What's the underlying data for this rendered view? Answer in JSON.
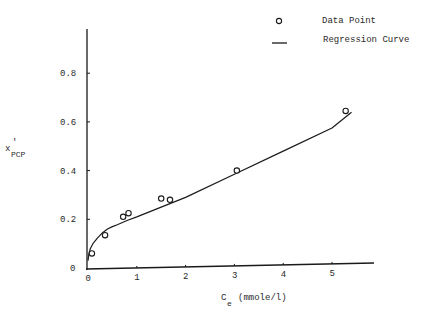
{
  "chart_data": {
    "type": "scatter",
    "title": "",
    "xlabel": "C_e (mmole/l)",
    "xlabel_main": "C",
    "xlabel_sub": "e",
    "xlabel_unit": "(mmole/l)",
    "ylabel": "x'_PCP",
    "ylabel_main": "x",
    "ylabel_prime": "'",
    "ylabel_sub": "PCP",
    "xlim": [
      0,
      5.8
    ],
    "ylim": [
      0,
      1.0
    ],
    "x_ticks": [
      0,
      1,
      2,
      3,
      4,
      5
    ],
    "x_tick_labels": [
      "0",
      "1",
      "2",
      "3",
      "4",
      "5"
    ],
    "y_ticks": [
      0,
      0.2,
      0.4,
      0.6,
      0.8
    ],
    "y_tick_labels": [
      "0",
      "0.2",
      "0.4",
      "0.6",
      "0.8"
    ],
    "grid": false,
    "legend_position": "top-right",
    "legend": [
      {
        "label": "Data Point",
        "marker": "open-circle"
      },
      {
        "label": "Regression Curve",
        "marker": "line"
      }
    ],
    "series": [
      {
        "name": "Data Point",
        "kind": "scatter",
        "x": [
          0.08,
          0.35,
          0.72,
          0.83,
          1.5,
          1.68,
          3.05,
          5.28
        ],
        "y": [
          0.06,
          0.135,
          0.21,
          0.225,
          0.285,
          0.28,
          0.4,
          0.645
        ]
      },
      {
        "name": "Regression Curve",
        "kind": "line",
        "x": [
          0.0,
          0.02,
          0.05,
          0.1,
          0.2,
          0.3,
          0.4,
          0.5,
          0.6,
          0.8,
          1.0,
          1.5,
          2.0,
          3.0,
          4.0,
          5.0,
          5.4
        ],
        "y": [
          0.03,
          0.06,
          0.08,
          0.1,
          0.125,
          0.145,
          0.16,
          0.17,
          0.178,
          0.195,
          0.21,
          0.25,
          0.29,
          0.385,
          0.48,
          0.575,
          0.64
        ]
      }
    ]
  }
}
